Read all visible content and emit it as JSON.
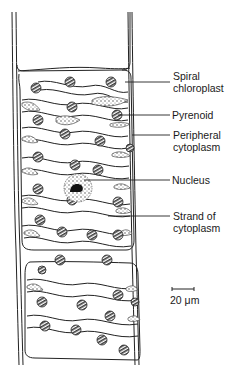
{
  "figure": {
    "labels": [
      {
        "id": "spiral-chloroplast",
        "lines": [
          "Spiral",
          "chloroplast"
        ],
        "x": 175,
        "y": 41,
        "pointer": {
          "x1": 125,
          "y1": 82,
          "x2": 170,
          "y2": 82
        }
      },
      {
        "id": "pyrenoid",
        "lines": [
          "Pyrenoid"
        ],
        "x": 172,
        "y": 107,
        "pointer": {
          "x1": 118,
          "y1": 115,
          "x2": 170,
          "y2": 115
        }
      },
      {
        "id": "peripheral-cytoplasm",
        "lines": [
          "Peripheral",
          "cytoplasm"
        ],
        "x": 173,
        "y": 131,
        "pointer": {
          "x1": 132,
          "y1": 135,
          "x2": 170,
          "y2": 135
        }
      },
      {
        "id": "nucleus",
        "lines": [
          "Nucleus"
        ],
        "x": 173,
        "y": 175,
        "pointer": {
          "x1": 80,
          "y1": 180,
          "x2": 170,
          "y2": 180
        }
      },
      {
        "id": "strand-of-cytoplasm",
        "lines": [
          "Strand of",
          "cytoplasm"
        ],
        "x": 173,
        "y": 210,
        "pointer": {
          "x1": 108,
          "y1": 216,
          "x2": 170,
          "y2": 216
        }
      }
    ],
    "scale_bar": {
      "label": "20 μm",
      "x1": 172,
      "x2": 194,
      "y": 289
    }
  }
}
